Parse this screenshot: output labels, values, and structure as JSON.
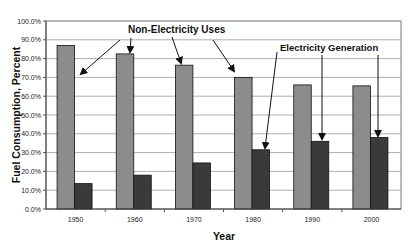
{
  "chart_data": {
    "type": "bar",
    "title": "",
    "xlabel": "Year",
    "ylabel": "Fuel Consumption, Percent",
    "categories": [
      "1950",
      "1960",
      "1970",
      "1980",
      "1990",
      "2000"
    ],
    "series": [
      {
        "name": "Non-Electricity Uses",
        "values": [
          87.0,
          82.5,
          76.5,
          70.0,
          66.0,
          65.5
        ],
        "color": "#8c8c8c"
      },
      {
        "name": "Electricity Generation",
        "values": [
          13.5,
          18.0,
          24.5,
          31.5,
          36.0,
          38.0
        ],
        "color": "#3a3a3a"
      }
    ],
    "ylim": [
      0,
      100
    ],
    "yticks": [
      "0.0%",
      "10.0%",
      "20.0%",
      "30.0%",
      "40.0%",
      "50.0%",
      "60.0%",
      "70.0%",
      "80.0%",
      "90.0%",
      "100.0%"
    ],
    "grid": true,
    "legend": "none",
    "annotations": [
      {
        "text": "Non-Electricity Uses",
        "points_to_series": "Non-Electricity Uses",
        "points_to_categories": [
          "1950",
          "1960",
          "1970",
          "1980"
        ]
      },
      {
        "text": "Electricity Generation",
        "points_to_series": "Electricity Generation",
        "points_to_categories": [
          "1980",
          "1990",
          "2000"
        ]
      }
    ]
  }
}
